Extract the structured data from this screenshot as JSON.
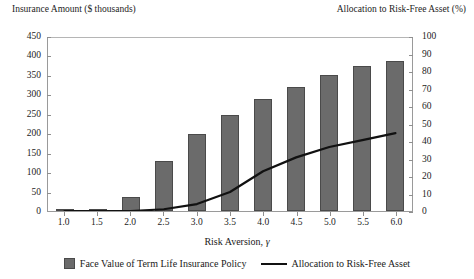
{
  "chart_data": {
    "type": "bar",
    "title": "",
    "xlabel": "Risk Aversion, γ",
    "categories": [
      "1.0",
      "1.5",
      "2.0",
      "2.5",
      "3.0",
      "3.5",
      "4.0",
      "4.5",
      "5.0",
      "5.5",
      "6.0"
    ],
    "x": [
      1.0,
      1.5,
      2.0,
      2.5,
      3.0,
      3.5,
      4.0,
      4.5,
      5.0,
      5.5,
      6.0
    ],
    "grid": false,
    "legend_position": "bottom",
    "left_axis": {
      "label": "Insurance Amount ($ thousands)",
      "ylim": [
        0,
        450
      ],
      "ticks": [
        0,
        50,
        100,
        150,
        200,
        250,
        300,
        350,
        400,
        450
      ]
    },
    "right_axis": {
      "label": "Allocation to Risk-Free Asset (%)",
      "ylim": [
        0,
        100
      ],
      "ticks": [
        0,
        10,
        20,
        30,
        40,
        50,
        60,
        70,
        80,
        90,
        100
      ]
    },
    "series": [
      {
        "name": "Face Value of Term Life Insurance Policy",
        "type": "bar",
        "axis": "left",
        "color": "#6b6b6b",
        "values": [
          5,
          3,
          35,
          128,
          198,
          248,
          287,
          320,
          350,
          372,
          385
        ]
      },
      {
        "name": "Allocation to Risk-Free Asset",
        "type": "line",
        "axis": "right",
        "color": "#111111",
        "values": [
          0,
          0,
          0,
          1,
          4,
          11,
          23,
          31,
          37,
          41,
          45
        ]
      }
    ]
  },
  "legend": {
    "items": [
      {
        "label": "Face Value of Term Life Insurance Policy",
        "marker": "square-swatch"
      },
      {
        "label": "Allocation to Risk-Free Asset",
        "marker": "line-swatch"
      }
    ]
  }
}
